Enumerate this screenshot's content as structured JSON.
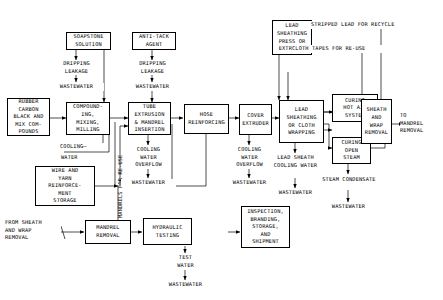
{
  "diagram": {
    "line_color": "#000000",
    "background": "#ffffff",
    "boxes": [
      {
        "id": "soapstone",
        "text": "SOAPSTONE\nSOLUTION"
      },
      {
        "id": "antitack",
        "text": "ANTI-TACK\nAGENT"
      },
      {
        "id": "leadpress",
        "text": "LEAD\nSHEATHING\nPRESS OR\nEXTRUDER"
      },
      {
        "id": "rubber",
        "text": "RUBBER\nCARBON\nBLACK AND\nMIX COM-\nPOUNDS"
      },
      {
        "id": "compound",
        "text": "COMPOUND-\nING,\nMIXING,\nMILLING"
      },
      {
        "id": "tubeextr",
        "text": "TUBE\nEXTRUSION\n& MANDREL\nINSERTION"
      },
      {
        "id": "hosereinf",
        "text": "HOSE\nREINFORCING"
      },
      {
        "id": "coverextr",
        "text": "COVER\nEXTRUDER"
      },
      {
        "id": "leadsheath",
        "text": "LEAD\nSHEATHING\nOR CLOTH\nWRAPPING"
      },
      {
        "id": "curinghot",
        "text": "CURING\nHOT AIR\nSYSTEM"
      },
      {
        "id": "curingsteam",
        "text": "CURING\nOPEN\nSTEAM"
      },
      {
        "id": "sheathwrap",
        "text": "SHEATH\nAND\nWRAP\nREMOVAL"
      },
      {
        "id": "wireyarn",
        "text": "WIRE AND\nYARN\nREINFORCE-\nMENT\nSTORAGE"
      },
      {
        "id": "mandrelrem",
        "text": "MANDREL\nREMOVAL"
      },
      {
        "id": "hydraulic",
        "text": "HYDRAULIC\nTESTING"
      },
      {
        "id": "inspection",
        "text": "INSPECTION,\nBRANDING,\nSTORAGE,\nAND\nSHIPMENT"
      }
    ],
    "labels": [
      {
        "id": "drip1",
        "text": "DRIPPING\nLEAKAGE"
      },
      {
        "id": "waste1",
        "text": "WASTEWATER"
      },
      {
        "id": "drip2",
        "text": "DRIPPING\nLEAKAGE"
      },
      {
        "id": "waste2",
        "text": "WASTEWATER"
      },
      {
        "id": "strippedlead",
        "text": "STRIPPED LEAD FOR RECYCLE"
      },
      {
        "id": "clothtapes",
        "text": "CLOTH TAPES FOR RE-USE"
      },
      {
        "id": "cooling",
        "text": "COOLING—"
      },
      {
        "id": "coolwater",
        "text": "WATER"
      },
      {
        "id": "mandrelsreuse",
        "text": "MANDRELS FOR RE-USE"
      },
      {
        "id": "cwo1",
        "text": "COOLING\nWATER\nOVERFLOW"
      },
      {
        "id": "waste3",
        "text": "WASTEWATER"
      },
      {
        "id": "cwo2",
        "text": "COOLING\nWATER\nOVERFLOW"
      },
      {
        "id": "waste4",
        "text": "WASTEWATER"
      },
      {
        "id": "leadsheathcw",
        "text": "LEAD SHEATH\nCOOLING WATER"
      },
      {
        "id": "waste5",
        "text": "WASTEWATER"
      },
      {
        "id": "steamcond",
        "text": "STEAM CONDENSATE"
      },
      {
        "id": "waste6",
        "text": "WASTEWATER"
      },
      {
        "id": "tomandrel",
        "text": "TO\nMANDREL\nREMOVAL"
      },
      {
        "id": "fromsheath",
        "text": "FROM SHEATH\nAND WRAP\nREMOVAL"
      },
      {
        "id": "testwater",
        "text": "TEST\nWATER"
      },
      {
        "id": "waste7",
        "text": "WASTEWATER"
      }
    ]
  }
}
